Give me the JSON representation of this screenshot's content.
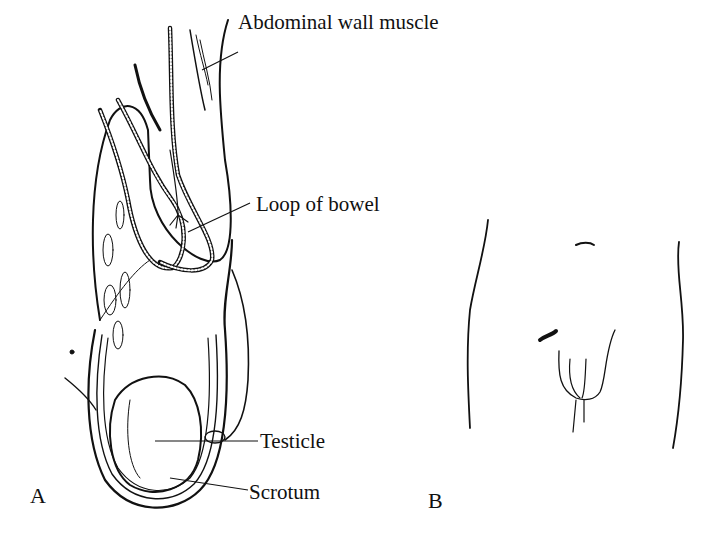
{
  "figure": {
    "panels": [
      {
        "id": "A",
        "label": "A",
        "description": "Cross-section of inguinal hernia",
        "callouts": [
          {
            "key": "abdominal_wall_muscle",
            "text": "Abdominal wall muscle"
          },
          {
            "key": "loop_of_bowel",
            "text": "Loop of bowel"
          },
          {
            "key": "testicle",
            "text": "Testicle"
          },
          {
            "key": "scrotum",
            "text": "Scrotum"
          }
        ]
      },
      {
        "id": "B",
        "label": "B",
        "description": "Frontal view of lower abdomen with groin bulge"
      }
    ]
  },
  "labels": {
    "abdominal_wall_muscle": "Abdominal wall muscle",
    "loop_of_bowel": "Loop of bowel",
    "testicle": "Testicle",
    "scrotum": "Scrotum",
    "panel_a": "A",
    "panel_b": "B"
  },
  "colors": {
    "ink": "#111111",
    "background": "#ffffff"
  }
}
